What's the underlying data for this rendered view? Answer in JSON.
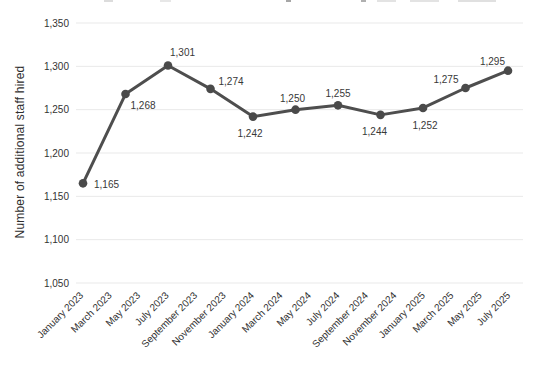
{
  "window": {
    "background": "#ffffff"
  },
  "chart_data": {
    "type": "line",
    "title": "",
    "xlabel": "",
    "ylabel": "Number of additional staff hired",
    "ylim": [
      1050,
      1350
    ],
    "grid": "horizontal",
    "legend": false,
    "y_ticks": [
      1350,
      1300,
      1250,
      1200,
      1150,
      1100,
      1050
    ],
    "y_tick_labels": [
      "1,350",
      "1,300",
      "1,250",
      "1,200",
      "1,150",
      "1,100",
      "1,050"
    ],
    "x_tick_labels": [
      "January 2023",
      "March 2023",
      "May 2023",
      "July 2023",
      "September 2023",
      "November 2023",
      "January 2024",
      "March 2024",
      "May 2024",
      "July 2024",
      "September 2024",
      "November 2024",
      "January 2025",
      "March 2025",
      "May 2025",
      "July 2025"
    ],
    "series": [
      {
        "name": "Number of additional staff hired",
        "values": [
          1165,
          1268,
          1301,
          1274,
          1242,
          1250,
          1255,
          1244,
          1252,
          1275,
          1295
        ],
        "data_labels": [
          "1,165",
          "1,268",
          "1,301",
          "1,274",
          "1,242",
          "1,250",
          "1,255",
          "1,244",
          "1,252",
          "1,275",
          "1,295"
        ]
      }
    ],
    "colors": {
      "line": "#4e4e4e",
      "marker": "#4a4a4a",
      "grid": "#e9e9e9",
      "data_label": "#383838",
      "tick_label": "#333333",
      "axis_title": "#2e2e2e"
    }
  }
}
